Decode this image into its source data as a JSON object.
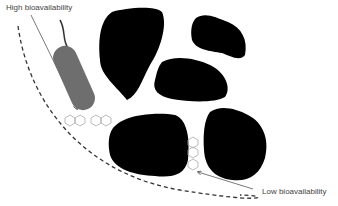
{
  "labels": {
    "high": "High bioavailability",
    "low": "Low bioavailability"
  },
  "colors": {
    "particle": "#000000",
    "bacterium": "#6e6e6e",
    "line": "#555555",
    "molecule": "#aaaaaa"
  }
}
